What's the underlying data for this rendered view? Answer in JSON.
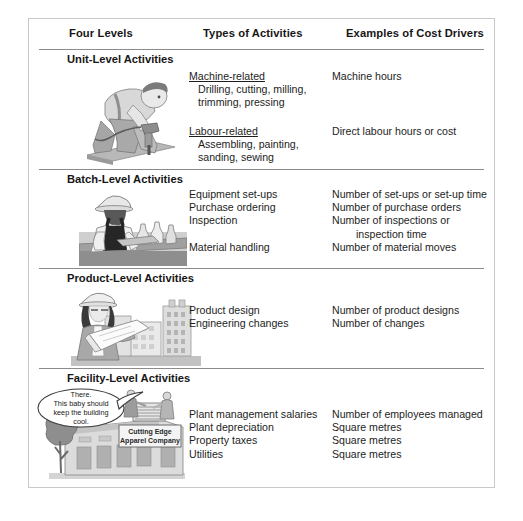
{
  "table": {
    "headers": {
      "levels": "Four Levels",
      "types": "Types of Activities",
      "drivers": "Examples of Cost Drivers"
    },
    "sections": [
      {
        "id": "unit-level",
        "title": "Unit-Level Activities",
        "illustration": "worker-drilling-illustration",
        "groups": [
          {
            "heading": "Machine-related",
            "activities": [
              "Drilling, cutting, milling,",
              "trimming, pressing"
            ],
            "drivers": [
              "Machine hours"
            ]
          },
          {
            "heading": "Labour-related",
            "activities": [
              "Assembling, painting,",
              "sanding, sewing"
            ],
            "drivers": [
              "Direct labour hours or cost"
            ]
          }
        ]
      },
      {
        "id": "batch-level",
        "title": "Batch-Level Activities",
        "illustration": "worker-bench-illustration",
        "activities": [
          "Equipment set-ups",
          "Purchase ordering",
          "Inspection",
          "",
          "Material handling"
        ],
        "drivers": [
          "Number of set-ups or set-up time",
          "Number of purchase orders",
          "Number of inspections or",
          "inspection time",
          "Number of material moves"
        ]
      },
      {
        "id": "product-level",
        "title": "Product-Level Activities",
        "illustration": "engineer-blueprint-illustration",
        "activities": [
          "Product design",
          "Engineering changes"
        ],
        "drivers": [
          "Number of product designs",
          "Number of changes"
        ]
      },
      {
        "id": "facility-level",
        "title": "Facility-Level Activities",
        "illustration": "factory-building-illustration",
        "activities": [
          "Plant management salaries",
          "Plant depreciation",
          "Property taxes",
          "Utilities"
        ],
        "drivers": [
          "Number of employees managed",
          "Square metres",
          "Square metres",
          "Square metres"
        ],
        "speech_bubble": {
          "line1": "There.",
          "line2": "This baby should",
          "line3": "keep the building",
          "line4": "cool."
        },
        "building_sign": {
          "line1": "Cutting Edge",
          "line2": "Apparel Company"
        }
      }
    ]
  },
  "colors": {
    "rule": "#8b8b8b",
    "frame_border": "#c9c9c9",
    "text": "#1d1d1d",
    "heading_text": "#161616",
    "art_dark": "#6e6e6e",
    "art_mid": "#9a9a9a",
    "art_light": "#c8c8c8",
    "art_pale": "#e2e2e2"
  }
}
